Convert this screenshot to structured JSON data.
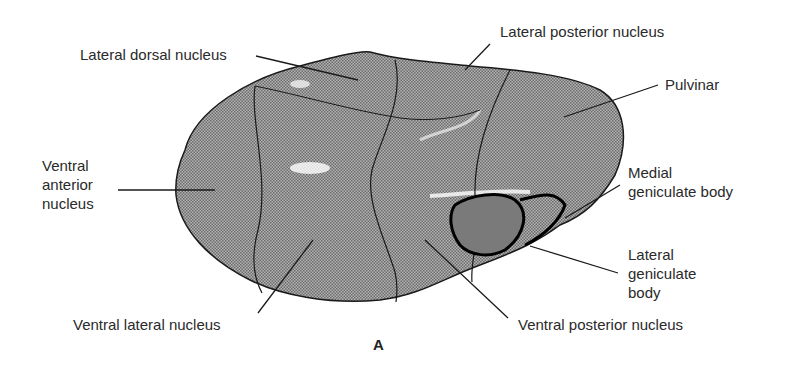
{
  "figure": {
    "panel_label": "A",
    "labels": {
      "lateral_dorsal": "Lateral dorsal nucleus",
      "lateral_posterior": "Lateral posterior nucleus",
      "pulvinar": "Pulvinar",
      "ventral_anterior": [
        "Ventral",
        "anterior",
        "nucleus"
      ],
      "medial_geniculate": [
        "Medial",
        "geniculate body"
      ],
      "lateral_geniculate": [
        "Lateral",
        "geniculate",
        "body"
      ],
      "ventral_lateral": "Ventral lateral nucleus",
      "ventral_posterior": "Ventral posterior nucleus"
    },
    "colors": {
      "fill": "#9a9a9a",
      "outline": "#1a1a1a",
      "lgb_fill": "#5a5a5a"
    }
  }
}
